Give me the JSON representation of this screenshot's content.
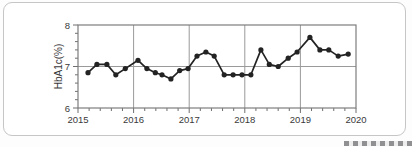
{
  "card": {
    "background": "#ffffff",
    "border_color": "#c6c6c6"
  },
  "chart_data": {
    "type": "line",
    "title": "",
    "xlabel": "",
    "ylabel": "HbA1c(%)",
    "xlim": [
      2015,
      2020
    ],
    "ylim": [
      6,
      8
    ],
    "x_ticks": {
      "values": [
        2015,
        2016,
        2017,
        2018,
        2019,
        2020
      ],
      "labels": [
        "2015",
        "2016",
        "2017",
        "2018",
        "2019",
        "2020"
      ]
    },
    "y_ticks": {
      "values": [
        6,
        7,
        8
      ],
      "labels": [
        "6",
        "7",
        "8"
      ]
    },
    "x_minor_tick_step": 0.2,
    "y_minor_tick_step": 0.2,
    "grid": {
      "vertical_at": [
        2016,
        2017,
        2018,
        2019
      ],
      "horizontal_at": [
        7
      ]
    },
    "legend_position": "none",
    "line_color": "#232323",
    "grid_color": "#9a9a9a",
    "series": [
      {
        "name": "HbA1c",
        "marker": "circle",
        "points": [
          [
            2015.18,
            6.85
          ],
          [
            2015.34,
            7.05
          ],
          [
            2015.52,
            7.05
          ],
          [
            2015.68,
            6.8
          ],
          [
            2015.85,
            6.95
          ],
          [
            2016.08,
            7.15
          ],
          [
            2016.24,
            6.95
          ],
          [
            2016.39,
            6.85
          ],
          [
            2016.51,
            6.8
          ],
          [
            2016.67,
            6.7
          ],
          [
            2016.83,
            6.9
          ],
          [
            2016.98,
            6.95
          ],
          [
            2017.14,
            7.25
          ],
          [
            2017.3,
            7.35
          ],
          [
            2017.45,
            7.25
          ],
          [
            2017.63,
            6.8
          ],
          [
            2017.79,
            6.8
          ],
          [
            2017.95,
            6.8
          ],
          [
            2018.11,
            6.8
          ],
          [
            2018.29,
            7.4
          ],
          [
            2018.44,
            7.05
          ],
          [
            2018.6,
            7.0
          ],
          [
            2018.78,
            7.2
          ],
          [
            2018.94,
            7.35
          ],
          [
            2019.17,
            7.7
          ],
          [
            2019.35,
            7.4
          ],
          [
            2019.51,
            7.4
          ],
          [
            2019.68,
            7.25
          ],
          [
            2019.86,
            7.3
          ]
        ]
      }
    ]
  }
}
